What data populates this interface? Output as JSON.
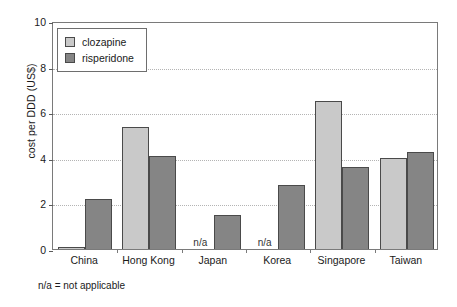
{
  "chart_data": {
    "type": "bar",
    "title": "",
    "xlabel": "",
    "ylabel": "cost per DDD (US$)",
    "categories": [
      "China",
      "Hong Kong",
      "Japan",
      "Korea",
      "Singapore",
      "Taiwan"
    ],
    "series": [
      {
        "name": "clozapine",
        "color": "#c9c9c9",
        "values": [
          0.08,
          5.35,
          null,
          null,
          6.5,
          4.0
        ],
        "value_labels": [
          "0.08",
          "5.35",
          "n/a",
          "n/a",
          "6.5",
          "4.0"
        ]
      },
      {
        "name": "risperidone",
        "color": "#858585",
        "values": [
          2.2,
          4.1,
          1.5,
          2.8,
          3.6,
          4.25
        ],
        "value_labels": [
          "2.2",
          "4.1",
          "1.5",
          "2.8",
          "3.6",
          "4.25"
        ]
      }
    ],
    "ylim": [
      0,
      10
    ],
    "yticks": [
      0,
      2,
      4,
      6,
      8,
      10
    ],
    "ytick_labels": [
      "0",
      "2",
      "4",
      "6",
      "8",
      "10"
    ],
    "grid": true,
    "grid_axis": "y",
    "legend_position": "upper-left",
    "na_marker": "n/a",
    "annotations": [
      "n/a = not applicable"
    ]
  },
  "legend": {
    "items": [
      {
        "label": "clozapine"
      },
      {
        "label": "risperidone"
      }
    ]
  },
  "footnote": {
    "text": "n/a = not applicable"
  },
  "colors": {
    "clozapine": "#c9c9c9",
    "risperidone": "#858585",
    "axis": "#7a7a7a",
    "grid": "#b4b4b4",
    "text": "#1a1a1a"
  }
}
